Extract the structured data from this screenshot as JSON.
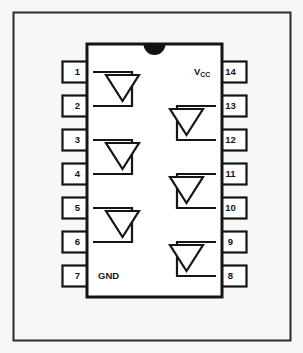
{
  "diagram": {
    "package": {
      "pin_count": 14,
      "notch": "semicircle-notch-top-center"
    },
    "colors": {
      "background": "#f8f7f5",
      "ink": "#151515",
      "body_fill": "#ffffff",
      "notch_fill": "#121212",
      "frame": "#2a2a2a"
    },
    "left_pins": [
      {
        "number": "1",
        "label": ""
      },
      {
        "number": "2",
        "label": ""
      },
      {
        "number": "3",
        "label": ""
      },
      {
        "number": "4",
        "label": ""
      },
      {
        "number": "5",
        "label": ""
      },
      {
        "number": "6",
        "label": ""
      },
      {
        "number": "7",
        "label": "GND"
      }
    ],
    "right_pins": [
      {
        "number": "14",
        "label": "Vcc"
      },
      {
        "number": "13",
        "label": ""
      },
      {
        "number": "12",
        "label": ""
      },
      {
        "number": "11",
        "label": ""
      },
      {
        "number": "10",
        "label": ""
      },
      {
        "number": "9",
        "label": ""
      },
      {
        "number": "8",
        "label": ""
      }
    ],
    "power_labels": {
      "vcc_main": "V",
      "vcc_sub": "CC",
      "gnd": "GND"
    },
    "gates": [
      {
        "id": "gate-left-1",
        "side": "left",
        "inputs": [
          "1",
          "2"
        ]
      },
      {
        "id": "gate-left-2",
        "side": "left",
        "inputs": [
          "3",
          "4"
        ]
      },
      {
        "id": "gate-left-3",
        "side": "left",
        "inputs": [
          "5",
          "6"
        ]
      },
      {
        "id": "gate-right-1",
        "side": "right",
        "inputs": [
          "13",
          "12"
        ]
      },
      {
        "id": "gate-right-2",
        "side": "right",
        "inputs": [
          "11",
          "10"
        ]
      },
      {
        "id": "gate-right-3",
        "side": "right",
        "inputs": [
          "9",
          "8"
        ]
      }
    ]
  }
}
